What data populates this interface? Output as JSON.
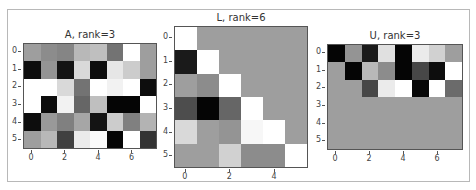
{
  "figure": {
    "panels": [
      {
        "id": "A",
        "title": "A, rank=3",
        "rows": 6,
        "cols": 8,
        "box": {
          "left": 23,
          "top": 43,
          "width": 134,
          "height": 106
        },
        "xticks": [
          0,
          2,
          4,
          6
        ],
        "yticks": [
          0,
          1,
          2,
          3,
          4,
          5
        ]
      },
      {
        "id": "L",
        "title": "L, rank=6",
        "rows": 6,
        "cols": 6,
        "box": {
          "left": 174,
          "top": 26,
          "width": 134,
          "height": 142
        },
        "xticks": [
          0,
          2,
          4
        ],
        "yticks": [
          0,
          1,
          2,
          3,
          4,
          5
        ]
      },
      {
        "id": "U",
        "title": "U, rank=3",
        "rows": 6,
        "cols": 8,
        "box": {
          "left": 327,
          "top": 44,
          "width": 136,
          "height": 106
        },
        "xticks": [
          0,
          2,
          4,
          6
        ],
        "yticks": [
          0,
          1,
          2,
          3,
          4,
          5
        ]
      }
    ]
  },
  "chart_data": [
    {
      "type": "heatmap",
      "title": "A, rank=3",
      "colormap": "gray",
      "xlabel": "",
      "ylabel": "",
      "xticks": [
        0,
        2,
        4,
        6
      ],
      "yticks": [
        0,
        1,
        2,
        3,
        4,
        5
      ],
      "values": [
        [
          0.62,
          0.55,
          0.52,
          0.72,
          0.75,
          0.45,
          1.0,
          0.62
        ],
        [
          0.05,
          0.58,
          0.08,
          0.85,
          0.05,
          0.9,
          0.8,
          0.62
        ],
        [
          1.0,
          1.0,
          0.85,
          0.45,
          1.0,
          0.95,
          1.0,
          0.05
        ],
        [
          1.0,
          0.05,
          0.95,
          0.4,
          0.75,
          0.02,
          0.02,
          1.0
        ],
        [
          0.05,
          0.6,
          0.5,
          0.65,
          0.08,
          0.8,
          0.5,
          0.7
        ],
        [
          0.62,
          0.72,
          0.25,
          0.92,
          0.98,
          0.02,
          1.0,
          0.2
        ]
      ]
    },
    {
      "type": "heatmap",
      "title": "L, rank=6",
      "colormap": "gray",
      "xlabel": "",
      "ylabel": "",
      "xticks": [
        0,
        2,
        4
      ],
      "yticks": [
        0,
        1,
        2,
        3,
        4,
        5
      ],
      "values": [
        [
          1.0,
          0.62,
          0.62,
          0.62,
          0.62,
          0.62
        ],
        [
          0.1,
          1.0,
          0.62,
          0.62,
          0.62,
          0.62
        ],
        [
          0.62,
          0.55,
          1.0,
          0.62,
          0.62,
          0.62
        ],
        [
          0.3,
          0.02,
          0.4,
          1.0,
          0.62,
          0.62
        ],
        [
          0.85,
          0.62,
          0.58,
          0.97,
          1.0,
          0.62
        ],
        [
          0.62,
          0.62,
          0.82,
          0.55,
          0.55,
          1.0
        ]
      ]
    },
    {
      "type": "heatmap",
      "title": "U, rank=3",
      "colormap": "gray",
      "xlabel": "",
      "ylabel": "",
      "xticks": [
        0,
        2,
        4,
        6
      ],
      "yticks": [
        0,
        1,
        2,
        3,
        4,
        5
      ],
      "values": [
        [
          0.02,
          0.58,
          0.1,
          0.88,
          0.02,
          0.92,
          0.82,
          0.62
        ],
        [
          0.62,
          0.02,
          0.72,
          0.55,
          0.02,
          0.28,
          0.05,
          1.0
        ],
        [
          0.62,
          0.62,
          0.28,
          0.92,
          1.0,
          0.03,
          1.0,
          0.42
        ],
        [
          0.62,
          0.62,
          0.62,
          0.62,
          0.62,
          0.62,
          0.62,
          0.62
        ],
        [
          0.62,
          0.62,
          0.62,
          0.62,
          0.62,
          0.62,
          0.62,
          0.62
        ],
        [
          0.62,
          0.62,
          0.62,
          0.62,
          0.62,
          0.62,
          0.62,
          0.62
        ]
      ]
    }
  ]
}
